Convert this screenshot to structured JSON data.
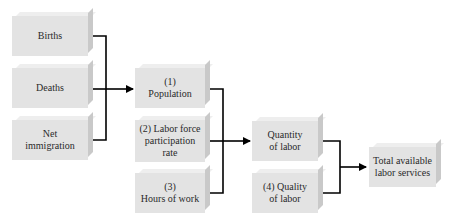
{
  "diagram": {
    "stage1": [
      {
        "id": "births",
        "label": "Births"
      },
      {
        "id": "deaths",
        "label": "Deaths"
      },
      {
        "id": "net-immigration",
        "label": "Net\nimmigration"
      }
    ],
    "stage2": [
      {
        "id": "population",
        "label": "(1)\nPopulation"
      },
      {
        "id": "labor-force-participation-rate",
        "label": "(2) Labor force\nparticipation\nrate"
      },
      {
        "id": "hours-of-work",
        "label": "(3)\nHours of work"
      }
    ],
    "stage3": [
      {
        "id": "quantity-of-labor",
        "label": "Quantity\nof labor"
      },
      {
        "id": "quality-of-labor",
        "label": "(4) Quality\nof labor"
      }
    ],
    "output": {
      "id": "total-available-labor-services",
      "label": "Total available\nlabor services"
    },
    "edges": [
      {
        "from": [
          "births",
          "deaths",
          "net-immigration"
        ],
        "to": "population"
      },
      {
        "from": [
          "population",
          "labor-force-participation-rate",
          "hours-of-work"
        ],
        "to": "quantity-of-labor"
      },
      {
        "from": [
          "quantity-of-labor",
          "quality-of-labor"
        ],
        "to": "total-available-labor-services"
      }
    ],
    "colors": {
      "box_face": "#e3e3e3",
      "box_side": "#c9c9c9",
      "box_top": "#eeeeee",
      "line": "#000000",
      "text": "#2a2a2a"
    }
  }
}
